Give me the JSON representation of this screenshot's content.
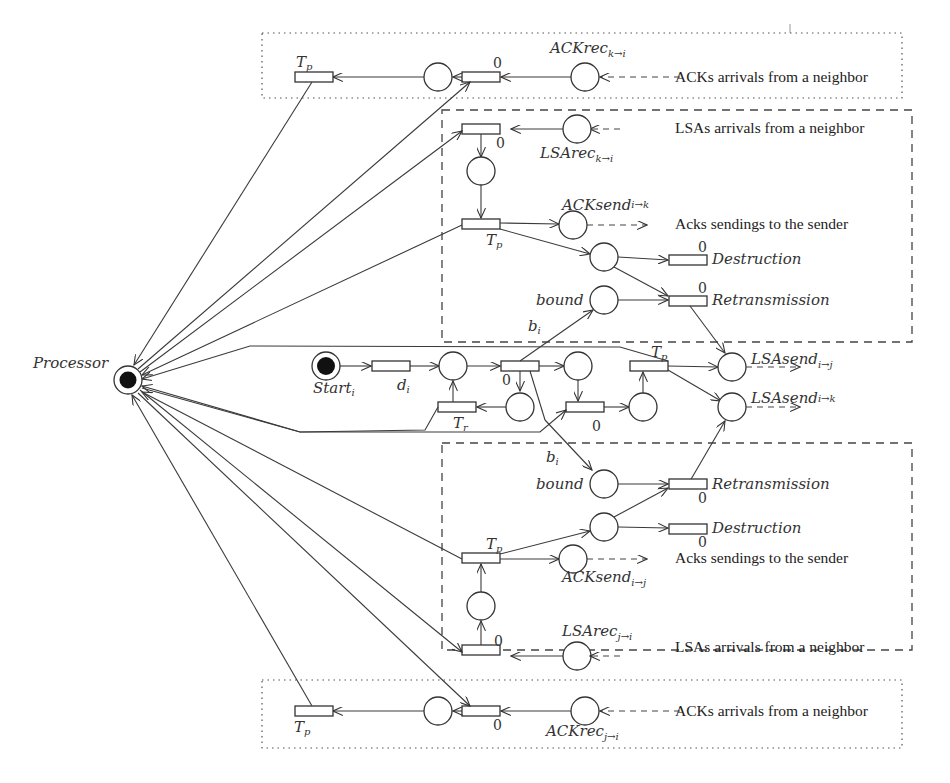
{
  "diagram": {
    "type": "petri-net",
    "processor": {
      "label": "Processor",
      "x": 128,
      "y": 380
    },
    "start": {
      "label": "Start",
      "sub": "i",
      "x": 326,
      "y": 366
    },
    "descriptions": {
      "ack_arrivals": "ACKs arrivals from a neighbor",
      "lsa_arrivals": "LSAs arrivals from a neighbor",
      "acks_sendings": "Acks sendings to the sender"
    },
    "labels": {
      "tp": "T",
      "tp_sub": "p",
      "tr": "T",
      "tr_sub": "r",
      "di": "d",
      "di_sub": "i",
      "bi": "b",
      "bi_sub": "i",
      "zero": "0",
      "bound": "bound",
      "destruction": "Destruction",
      "retransmission": "Retransmission",
      "ackrec_top": "ACKrec",
      "ackrec_top_sub": "k→i",
      "lsarec_top": "LSArec",
      "lsarec_top_sub": "k→i",
      "acksend_top": "ACKsend",
      "acksend_top_sub": "i→k",
      "lsasend_j": "LSAsend",
      "lsasend_j_sub": "i→j",
      "lsasend_k": "LSAsend",
      "lsasend_k_sub": "i→k",
      "acksend_bot": "ACKsend",
      "acksend_bot_sub": "i→j",
      "lsarec_bot": "LSArec",
      "lsarec_bot_sub": "j→i",
      "ackrec_bot": "ACKrec",
      "ackrec_bot_sub": "j→i"
    },
    "regions": [
      {
        "name": "top-ack-region",
        "style": "dotted",
        "x": 262,
        "y": 33,
        "w": 640,
        "h": 65
      },
      {
        "name": "upper-lsa-region",
        "style": "dashed",
        "x": 442,
        "y": 110,
        "w": 470,
        "h": 232
      },
      {
        "name": "lower-lsa-region",
        "style": "dashed",
        "x": 442,
        "y": 443,
        "w": 470,
        "h": 207
      },
      {
        "name": "bottom-ack-region",
        "style": "dotted",
        "x": 262,
        "y": 680,
        "w": 640,
        "h": 68
      }
    ]
  }
}
